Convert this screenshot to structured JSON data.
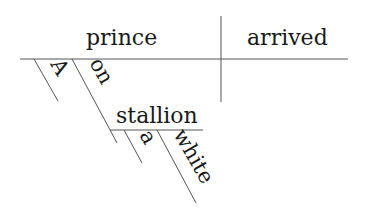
{
  "diagram": {
    "type": "Reed-Kellogg sentence diagram",
    "subject": "prince",
    "predicate": "arrived",
    "subject_modifiers": [
      "A",
      "on"
    ],
    "prepositional_object": "stallion",
    "object_modifiers": [
      "a",
      "white"
    ]
  },
  "colors": {
    "line": "#555555",
    "text": "#1a1a1a",
    "background": "#ffffff"
  }
}
